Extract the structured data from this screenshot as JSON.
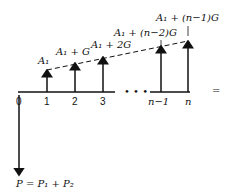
{
  "diagram": {
    "type": "cash-flow-diagram",
    "axis_labels": [
      "0",
      "1",
      "2",
      "3",
      "n−1",
      "n"
    ],
    "ellipsis": "• • •",
    "arrow_labels": [
      "A₁",
      "A₁ + G",
      "A₁ + 2G",
      "A₁ + (n−2)G",
      "A₁ + (n−1)G"
    ],
    "present_value_label": "P = P₁ + P₂",
    "equals_sign": "="
  }
}
